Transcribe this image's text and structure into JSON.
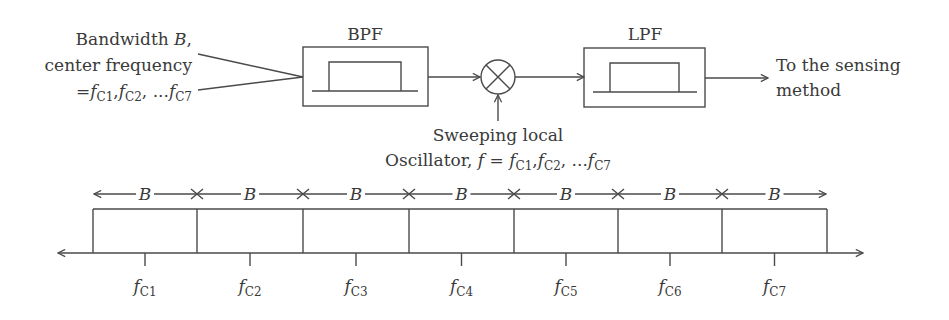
{
  "input_label": {
    "line1": "Bandwidth B,",
    "line1_text": "Bandwidth ",
    "line1_var": "B",
    "line1_end": ",",
    "line2": "center frequency",
    "line3_prefix": "=",
    "line3_f": "f",
    "line3_sub1": "C1",
    "line3_sub2": "C2",
    "line3_sub7": "C7",
    "line3_sep": ",",
    "line3_ellipsis": " ..."
  },
  "blocks": {
    "bpf": {
      "label": "BPF"
    },
    "mixer": {
      "symbol": "×"
    },
    "lpf": {
      "label": "LPF"
    }
  },
  "output_label": {
    "line1": "To the sensing",
    "line2": "method"
  },
  "oscillator_label": {
    "line1": "Sweeping local",
    "line2_text": "Oscillator, ",
    "line2_f": "f",
    "line2_eq": " = ",
    "sub1": "C1",
    "sub2": "C2",
    "sub7": "C7",
    "ellipsis": " ..."
  },
  "spectrum": {
    "bandwidth_label": "B",
    "channel_var": "f",
    "channels": [
      {
        "sub": "C1"
      },
      {
        "sub": "C2"
      },
      {
        "sub": "C3"
      },
      {
        "sub": "C4"
      },
      {
        "sub": "C5"
      },
      {
        "sub": "C6"
      },
      {
        "sub": "C7"
      }
    ]
  }
}
